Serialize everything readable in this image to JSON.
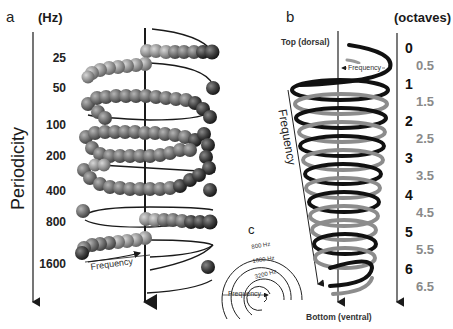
{
  "panel_a": {
    "letter": "a",
    "unit": "(Hz)",
    "axis_title": "Periodicity",
    "hz_labels": [
      "25",
      "50",
      "100",
      "200",
      "400",
      "800",
      "1600"
    ],
    "frequency_label": "Frequency",
    "colors": {
      "sphere_light": "#9a9a9a",
      "sphere_dark": "#3a3a3a",
      "line": "#1a1a1a"
    }
  },
  "panel_b": {
    "letter": "b",
    "top_label": "Top (dorsal)",
    "bottom_label": "Bottom (ventral)",
    "frequency_label_axis": "Frequency",
    "frequency_label_top": "Frequency",
    "colors": {
      "coil_black": "#111111",
      "coil_gray": "#8c8c8c"
    }
  },
  "octave_scale": {
    "unit": "(octaves)",
    "labels": [
      {
        "value": "0",
        "type": "int"
      },
      {
        "value": "0.5",
        "type": "half"
      },
      {
        "value": "1",
        "type": "int"
      },
      {
        "value": "1.5",
        "type": "half"
      },
      {
        "value": "2",
        "type": "int"
      },
      {
        "value": "2.5",
        "type": "half"
      },
      {
        "value": "3",
        "type": "int"
      },
      {
        "value": "3.5",
        "type": "half"
      },
      {
        "value": "4",
        "type": "int"
      },
      {
        "value": "4.5",
        "type": "half"
      },
      {
        "value": "5",
        "type": "int"
      },
      {
        "value": "5.5",
        "type": "half"
      },
      {
        "value": "6",
        "type": "int"
      },
      {
        "value": "6.5",
        "type": "half"
      }
    ]
  },
  "panel_c": {
    "letter": "c",
    "ring_labels": [
      "800 Hz",
      "1600 Hz",
      "3200 Hz"
    ],
    "frequency_label": "Frequency"
  }
}
